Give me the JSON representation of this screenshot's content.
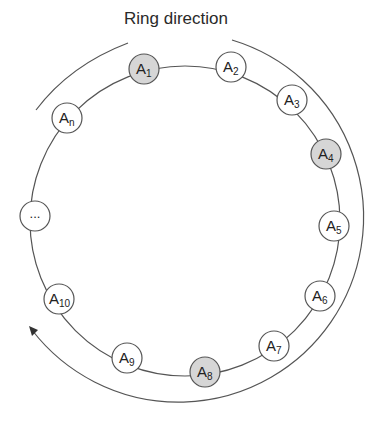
{
  "title": "Ring direction",
  "colors": {
    "line": "#555555",
    "highlight_fill": "#d6d6d6",
    "node_fill": "#ffffff"
  },
  "nodes": [
    {
      "id": "A1",
      "base": "A",
      "sub": "1",
      "highlighted": true
    },
    {
      "id": "A2",
      "base": "A",
      "sub": "2",
      "highlighted": false
    },
    {
      "id": "A3",
      "base": "A",
      "sub": "3",
      "highlighted": false
    },
    {
      "id": "A4",
      "base": "A",
      "sub": "4",
      "highlighted": true
    },
    {
      "id": "A5",
      "base": "A",
      "sub": "5",
      "highlighted": false
    },
    {
      "id": "A6",
      "base": "A",
      "sub": "6",
      "highlighted": false
    },
    {
      "id": "A7",
      "base": "A",
      "sub": "7",
      "highlighted": false
    },
    {
      "id": "A8",
      "base": "A",
      "sub": "8",
      "highlighted": true
    },
    {
      "id": "A9",
      "base": "A",
      "sub": "9",
      "highlighted": false
    },
    {
      "id": "A10",
      "base": "A",
      "sub": "10",
      "highlighted": false
    },
    {
      "id": "ellipsis",
      "base": "...",
      "sub": "",
      "highlighted": false
    },
    {
      "id": "An",
      "base": "A",
      "sub": "n",
      "highlighted": false
    }
  ]
}
